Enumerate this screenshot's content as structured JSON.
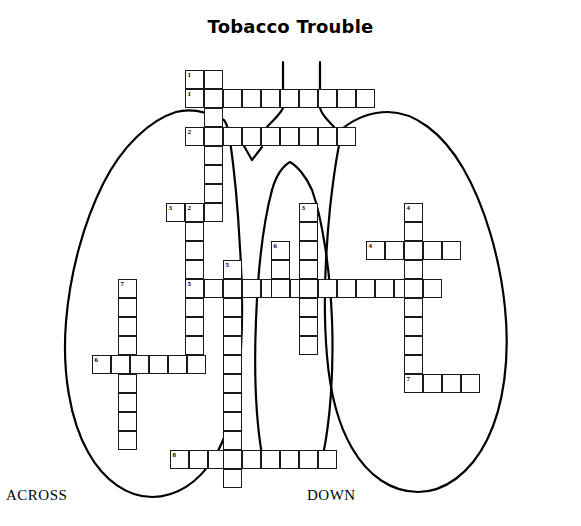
{
  "page": {
    "title": "Tobacco Trouble",
    "background_color": "#ffffff",
    "ink_color": "#000000",
    "width": 581,
    "height": 526
  },
  "footer": {
    "across_label": "ACROSS",
    "down_label": "DOWN"
  },
  "artwork": {
    "name": "lungs-diagram",
    "description": "hand-drawn outline of two lungs with trachea and bronchi behind the crossword grid",
    "stroke_color": "#000000",
    "stroke_width": 2.2
  },
  "crossword": {
    "cell_size": 19,
    "entries": [
      {
        "number": "1",
        "direction": "across",
        "length": 10,
        "start_col": 0,
        "start_row": 0
      },
      {
        "number": "2",
        "direction": "across",
        "length": 9,
        "start_col": 0,
        "start_row": 2
      },
      {
        "number": "3",
        "direction": "across",
        "length": 3,
        "start_col": -1,
        "start_row": 7
      },
      {
        "number": "4",
        "direction": "across",
        "length": 5,
        "start_col": 10,
        "start_row": 9
      },
      {
        "number": "5",
        "direction": "across",
        "length": 14,
        "start_col": 0,
        "start_row": 11
      },
      {
        "number": "6",
        "direction": "across",
        "length": 6,
        "start_col": -5,
        "start_row": 15
      },
      {
        "number": "7",
        "direction": "across",
        "length": 4,
        "start_col": 12,
        "start_row": 16
      },
      {
        "number": "8",
        "direction": "across",
        "length": 9,
        "start_col": -1,
        "start_row": 20
      },
      {
        "number": "1",
        "direction": "down",
        "length": 5,
        "start_col": 2,
        "start_row": -1
      },
      {
        "number": "2",
        "direction": "down",
        "length": 9,
        "start_col": 0,
        "start_row": 7
      },
      {
        "number": "3",
        "direction": "down",
        "length": 9,
        "start_col": 7,
        "start_row": 7
      },
      {
        "number": "4",
        "direction": "down",
        "length": 10,
        "start_col": 12,
        "start_row": 7
      },
      {
        "number": "5",
        "direction": "down",
        "length": 11,
        "start_col": 2,
        "start_row": 10
      },
      {
        "number": "6",
        "direction": "down",
        "length": 5,
        "start_col": 5,
        "start_row": 9
      },
      {
        "number": "7",
        "direction": "down",
        "length": 11,
        "start_col": -5,
        "start_row": 10
      }
    ],
    "cells": [
      {
        "x": 185,
        "y": 70,
        "n": "1"
      },
      {
        "x": 204,
        "y": 70
      },
      {
        "x": 185,
        "y": 89,
        "n": "1"
      },
      {
        "x": 204,
        "y": 89
      },
      {
        "x": 223,
        "y": 89
      },
      {
        "x": 242,
        "y": 89
      },
      {
        "x": 261,
        "y": 89
      },
      {
        "x": 280,
        "y": 89
      },
      {
        "x": 299,
        "y": 89
      },
      {
        "x": 318,
        "y": 89
      },
      {
        "x": 337,
        "y": 89
      },
      {
        "x": 356,
        "y": 89
      },
      {
        "x": 204,
        "y": 108
      },
      {
        "x": 185,
        "y": 127,
        "n": "2"
      },
      {
        "x": 204,
        "y": 127
      },
      {
        "x": 223,
        "y": 127
      },
      {
        "x": 242,
        "y": 127
      },
      {
        "x": 261,
        "y": 127
      },
      {
        "x": 280,
        "y": 127
      },
      {
        "x": 299,
        "y": 127
      },
      {
        "x": 318,
        "y": 127
      },
      {
        "x": 337,
        "y": 127
      },
      {
        "x": 204,
        "y": 146
      },
      {
        "x": 204,
        "y": 165
      },
      {
        "x": 204,
        "y": 184
      },
      {
        "x": 166,
        "y": 203,
        "n": "3"
      },
      {
        "x": 185,
        "y": 203,
        "n": "2"
      },
      {
        "x": 204,
        "y": 203
      },
      {
        "x": 299,
        "y": 203,
        "n": "3"
      },
      {
        "x": 404,
        "y": 203,
        "n": "4"
      },
      {
        "x": 185,
        "y": 222
      },
      {
        "x": 299,
        "y": 222
      },
      {
        "x": 404,
        "y": 222
      },
      {
        "x": 185,
        "y": 241
      },
      {
        "x": 271,
        "y": 241,
        "n": "6"
      },
      {
        "x": 299,
        "y": 241
      },
      {
        "x": 366,
        "y": 241,
        "n": "4"
      },
      {
        "x": 385,
        "y": 241
      },
      {
        "x": 404,
        "y": 241
      },
      {
        "x": 423,
        "y": 241
      },
      {
        "x": 442,
        "y": 241
      },
      {
        "x": 185,
        "y": 260
      },
      {
        "x": 223,
        "y": 260,
        "n": "5"
      },
      {
        "x": 271,
        "y": 260
      },
      {
        "x": 299,
        "y": 260
      },
      {
        "x": 404,
        "y": 260
      },
      {
        "x": 185,
        "y": 279,
        "n": "5"
      },
      {
        "x": 204,
        "y": 279
      },
      {
        "x": 223,
        "y": 279
      },
      {
        "x": 242,
        "y": 279
      },
      {
        "x": 261,
        "y": 279
      },
      {
        "x": 271,
        "y": 279
      },
      {
        "x": 290,
        "y": 279
      },
      {
        "x": 299,
        "y": 279
      },
      {
        "x": 318,
        "y": 279
      },
      {
        "x": 337,
        "y": 279
      },
      {
        "x": 356,
        "y": 279
      },
      {
        "x": 375,
        "y": 279
      },
      {
        "x": 394,
        "y": 279
      },
      {
        "x": 404,
        "y": 279
      },
      {
        "x": 423,
        "y": 279
      },
      {
        "x": 118,
        "y": 279,
        "n": "7"
      },
      {
        "x": 118,
        "y": 298
      },
      {
        "x": 185,
        "y": 298
      },
      {
        "x": 223,
        "y": 298
      },
      {
        "x": 299,
        "y": 298
      },
      {
        "x": 404,
        "y": 298
      },
      {
        "x": 118,
        "y": 317
      },
      {
        "x": 185,
        "y": 317
      },
      {
        "x": 223,
        "y": 317
      },
      {
        "x": 299,
        "y": 317
      },
      {
        "x": 404,
        "y": 317
      },
      {
        "x": 118,
        "y": 336
      },
      {
        "x": 185,
        "y": 336
      },
      {
        "x": 223,
        "y": 336
      },
      {
        "x": 299,
        "y": 336
      },
      {
        "x": 404,
        "y": 336
      },
      {
        "x": 92,
        "y": 355,
        "n": "6"
      },
      {
        "x": 111,
        "y": 355
      },
      {
        "x": 130,
        "y": 355
      },
      {
        "x": 149,
        "y": 355
      },
      {
        "x": 168,
        "y": 355
      },
      {
        "x": 187,
        "y": 355
      },
      {
        "x": 223,
        "y": 355
      },
      {
        "x": 404,
        "y": 355
      },
      {
        "x": 118,
        "y": 374
      },
      {
        "x": 223,
        "y": 374
      },
      {
        "x": 404,
        "y": 374,
        "n": "7"
      },
      {
        "x": 423,
        "y": 374
      },
      {
        "x": 442,
        "y": 374
      },
      {
        "x": 461,
        "y": 374
      },
      {
        "x": 118,
        "y": 393
      },
      {
        "x": 223,
        "y": 393
      },
      {
        "x": 118,
        "y": 412
      },
      {
        "x": 223,
        "y": 412
      },
      {
        "x": 118,
        "y": 431
      },
      {
        "x": 223,
        "y": 431
      },
      {
        "x": 170,
        "y": 450,
        "n": "8"
      },
      {
        "x": 189,
        "y": 450
      },
      {
        "x": 208,
        "y": 450
      },
      {
        "x": 223,
        "y": 450
      },
      {
        "x": 242,
        "y": 450
      },
      {
        "x": 261,
        "y": 450
      },
      {
        "x": 280,
        "y": 450
      },
      {
        "x": 299,
        "y": 450
      },
      {
        "x": 318,
        "y": 450
      },
      {
        "x": 223,
        "y": 469
      }
    ]
  }
}
